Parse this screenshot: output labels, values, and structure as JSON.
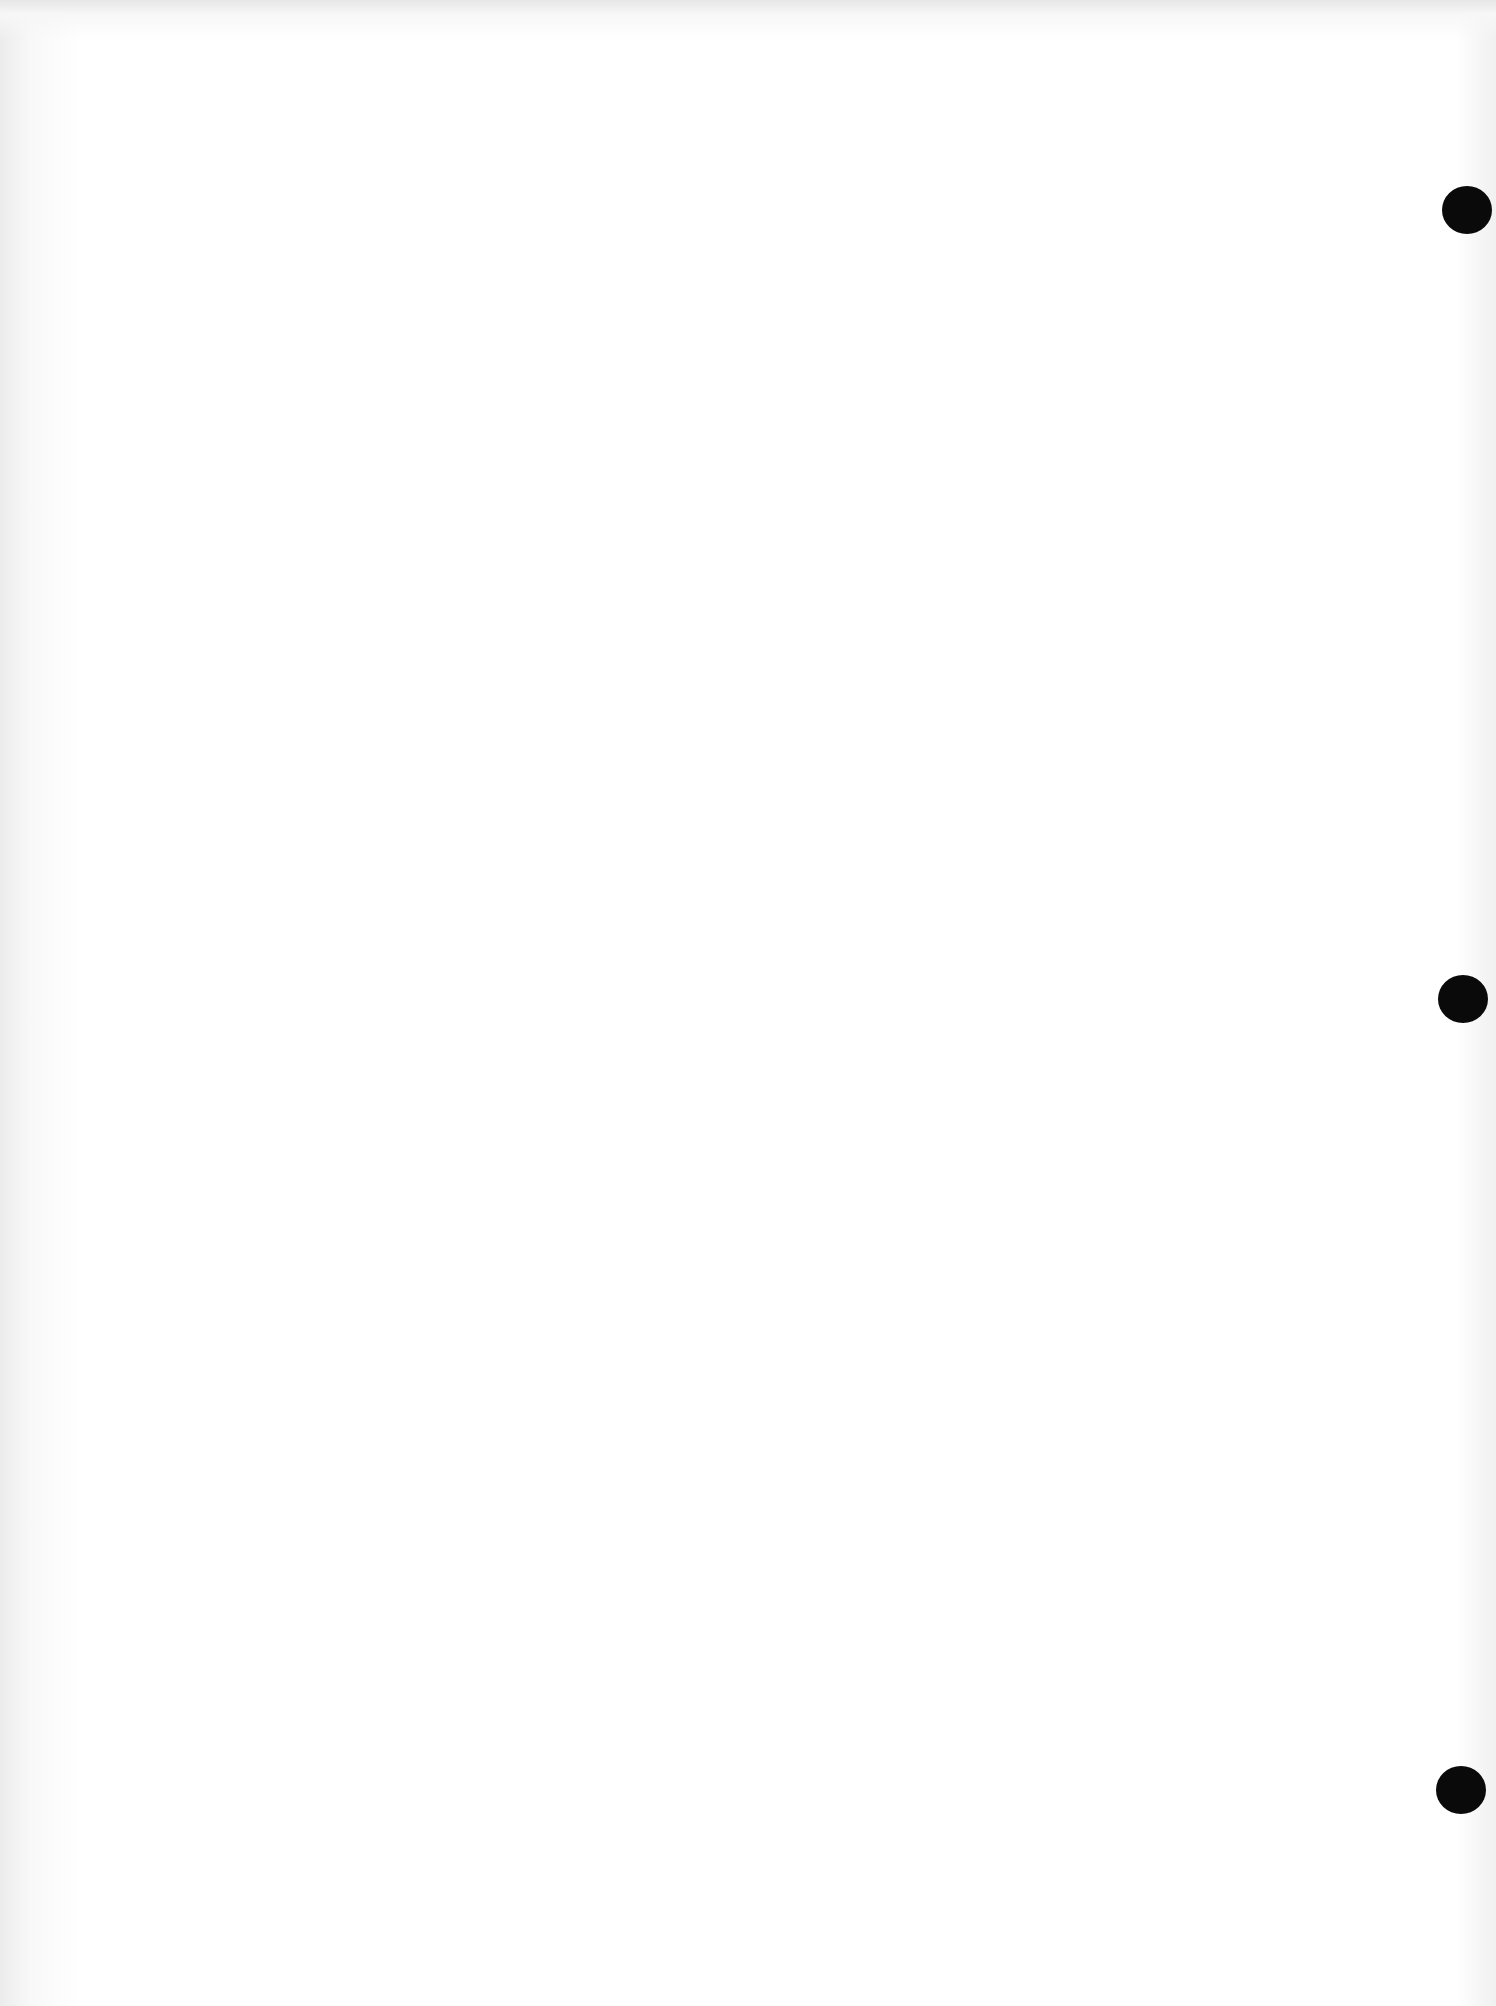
{
  "page": {
    "type": "blank scanned sheet",
    "background_color": "#ffffff",
    "text": ""
  },
  "punch_holes": [
    {
      "name": "punch-hole-top",
      "x": 1442,
      "y": 186,
      "color": "#0a0a0a"
    },
    {
      "name": "punch-hole-middle",
      "x": 1438,
      "y": 975,
      "color": "#0a0a0a"
    },
    {
      "name": "punch-hole-bottom",
      "x": 1436,
      "y": 1766,
      "color": "#0a0a0a"
    }
  ]
}
